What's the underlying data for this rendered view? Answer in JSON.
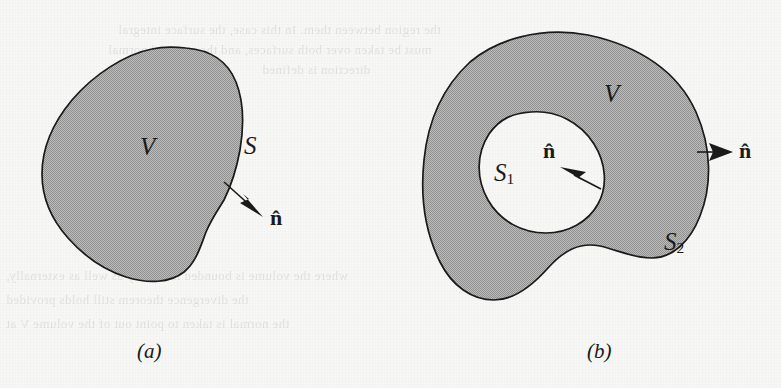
{
  "figure": {
    "background_color": "#f7f7f6",
    "fill_color": "#a9a9a9",
    "stroke_color": "#1a1a1a",
    "panels": [
      {
        "id": "a",
        "caption": "(a)",
        "labels": {
          "volume": "V",
          "surface": "S",
          "normal": "n̂"
        }
      },
      {
        "id": "b",
        "caption": "(b)",
        "labels": {
          "volume": "V",
          "inner_surface": "S",
          "inner_surface_sub": "1",
          "outer_surface": "S",
          "outer_surface_sub": "2",
          "inner_normal": "n̂",
          "outer_normal": "n̂"
        }
      }
    ]
  },
  "bleed_text": {
    "line_top_1": "the region between them. In this case, the surface integral",
    "line_top_2": "must be taken over both surfaces, and the outward normal",
    "line_top_3": "direction is defined",
    "line_bottom_1": "where the volume is bounded internally as well as externally,",
    "line_bottom_2": "the divergence theorem still holds provided",
    "line_bottom_3": "the normal is taken to point out of the volume V at"
  }
}
